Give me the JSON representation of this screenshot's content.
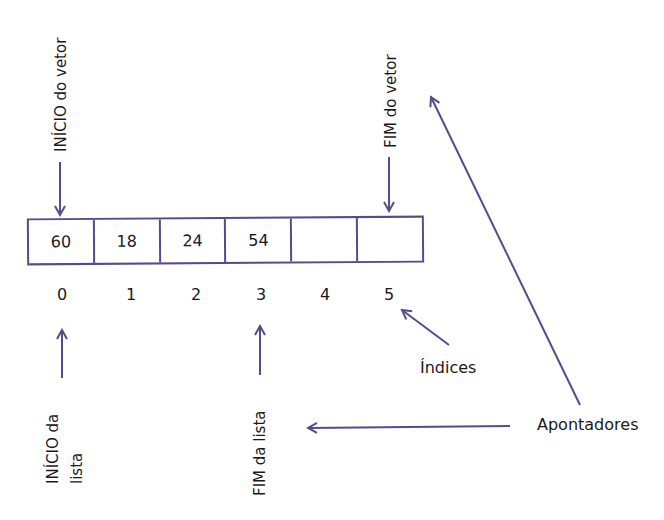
{
  "diagram": {
    "array": {
      "cells": [
        "60",
        "18",
        "24",
        "54",
        "",
        ""
      ],
      "indices": [
        "0",
        "1",
        "2",
        "3",
        "4",
        "5"
      ]
    },
    "labels": {
      "inicio_vetor": "INÍCIO do vetor",
      "fim_vetor": "FIM do vetor",
      "inicio_lista_line1": "INÍCIO da",
      "inicio_lista_line2": "lista",
      "fim_lista": "FIM da lista",
      "indices": "Índices",
      "apontadores": "Apontadores"
    },
    "colors": {
      "line": "#5a4a8a",
      "text": "#1a1a1a"
    }
  }
}
